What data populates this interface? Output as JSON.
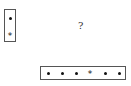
{
  "diagram": {
    "question_mark": "?",
    "vertical_box": {
      "orientation": "vertical",
      "items": [
        "dot",
        "star"
      ]
    },
    "horizontal_box": {
      "orientation": "horizontal",
      "items": [
        "dot",
        "dot",
        "dot",
        "star",
        "dot",
        "dot"
      ]
    },
    "symbols": {
      "star": "*"
    }
  }
}
